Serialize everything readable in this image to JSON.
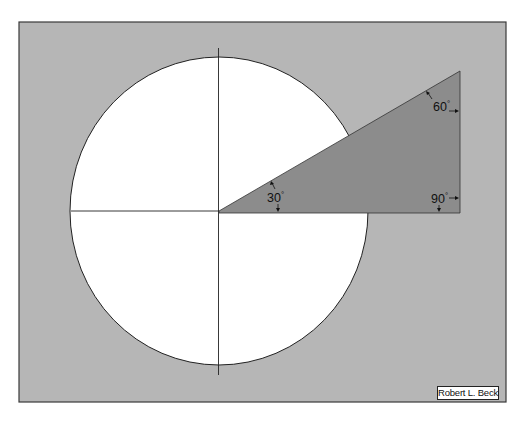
{
  "diagram": {
    "colors": {
      "page_background": "#ffffff",
      "panel_background": "#b6b6b6",
      "panel_border": "#3a3a3a",
      "circle_fill": "#ffffff",
      "line_color": "#222222",
      "triangle_fill": "#8c8c8c"
    },
    "circle": {
      "cx": 219,
      "cy": 211,
      "rx": 149,
      "ry": 154
    },
    "triangle": {
      "vertices": [
        [
          219,
          211
        ],
        [
          460,
          71
        ],
        [
          460,
          213
        ]
      ],
      "angles": [
        {
          "vertex": "origin",
          "label": "30",
          "unit": "°"
        },
        {
          "vertex": "top",
          "label": "60",
          "unit": "°"
        },
        {
          "vertex": "right",
          "label": "90",
          "unit": "°"
        }
      ]
    },
    "credit": "Robert L. Beck"
  }
}
